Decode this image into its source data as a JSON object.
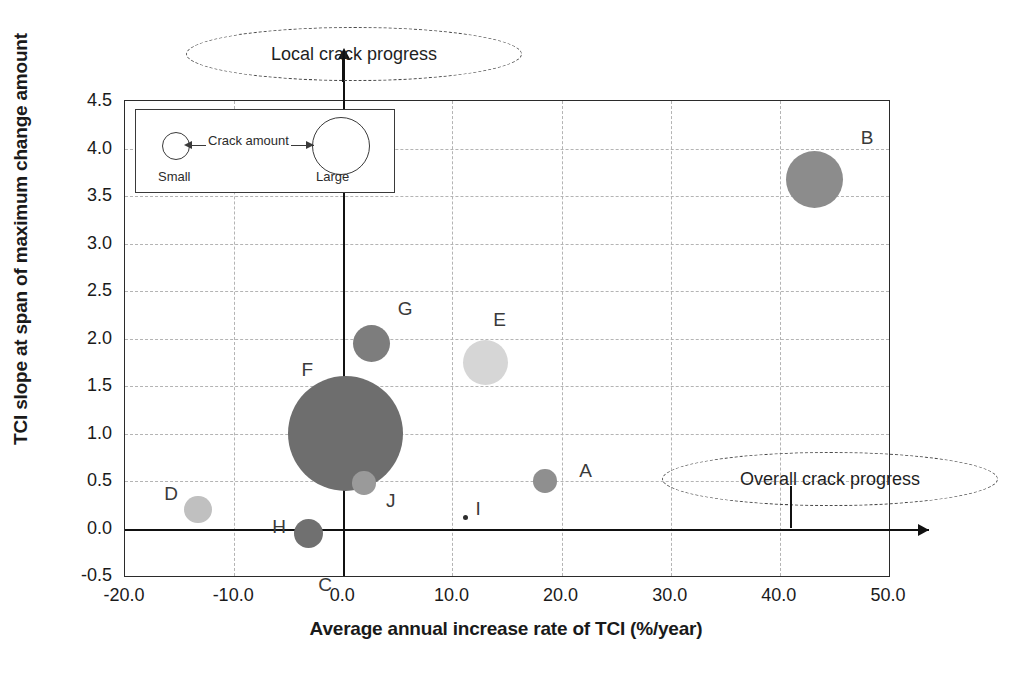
{
  "chart_data": {
    "type": "scatter",
    "title": "",
    "xlabel": "Average annual increase rate of TCI (%/year)",
    "ylabel": "TCI slope at span of maximum change amount",
    "xlim": [
      -20.0,
      50.0
    ],
    "ylim": [
      -0.5,
      4.5
    ],
    "xticks": [
      "-20.0",
      "-10.0",
      "0.0",
      "10.0",
      "20.0",
      "30.0",
      "40.0",
      "50.0"
    ],
    "yticks": [
      "4.5",
      "4.0",
      "3.5",
      "3.0",
      "2.5",
      "2.0",
      "1.5",
      "1.0",
      "0.5",
      "0.0",
      "-0.5"
    ],
    "grid": true,
    "legend_position": "none",
    "bubble_size_meaning": "Crack amount",
    "points": [
      {
        "label": "A",
        "x": 18.5,
        "y": 0.5,
        "size": 1.2,
        "color": "#8f8f8f",
        "label_dx": 34,
        "label_dy": -20
      },
      {
        "label": "B",
        "x": 43.2,
        "y": 3.67,
        "size": 2.9,
        "color": "#8c8c8c",
        "label_dx": 46,
        "label_dy": -52
      },
      {
        "label": "C",
        "x": -3.2,
        "y": -0.05,
        "size": 1.5,
        "color": "#707070",
        "label_dx": 10,
        "label_dy": 42
      },
      {
        "label": "D",
        "x": -13.3,
        "y": 0.2,
        "size": 1.4,
        "color": "#c0c0c0",
        "label_dx": -34,
        "label_dy": -26
      },
      {
        "label": "E",
        "x": 13.0,
        "y": 1.75,
        "size": 2.3,
        "color": "#d6d6d6",
        "label_dx": 8,
        "label_dy": -52
      },
      {
        "label": "F",
        "x": 0.2,
        "y": 1.0,
        "size": 5.9,
        "color": "#6e6e6e",
        "label_dx": -44,
        "label_dy": -74
      },
      {
        "label": "G",
        "x": 2.6,
        "y": 1.95,
        "size": 1.9,
        "color": "#7d7d7d",
        "label_dx": 26,
        "label_dy": -44
      },
      {
        "label": "H",
        "x": -3.2,
        "y": -0.05,
        "size": 0.0,
        "color": "#707070",
        "label_dx": -36,
        "label_dy": -16
      },
      {
        "label": "I",
        "x": 11.2,
        "y": 0.12,
        "size": 0.2,
        "color": "#2e2e2e",
        "label_dx": 10,
        "label_dy": -18
      },
      {
        "label": "J",
        "x": 1.9,
        "y": 0.48,
        "size": 1.2,
        "color": "#9a9a9a",
        "label_dx": 22,
        "label_dy": 8
      }
    ]
  },
  "size_legend": {
    "arrow_label": "Crack amount",
    "small_label": "Small",
    "large_label": "Large"
  },
  "callouts": {
    "top": "Local crack progress",
    "right": "Overall crack progress"
  },
  "colors": {
    "axis": "#2b2b2b",
    "grid": "#b4b4b4",
    "zero_axis": "#111111",
    "text": "#1a1a1a"
  }
}
